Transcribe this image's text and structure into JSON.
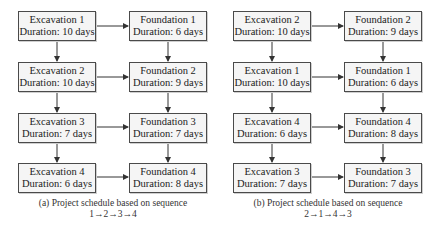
{
  "panels": [
    {
      "id": "a",
      "caption_line1": "(a) Project schedule based on sequence",
      "caption_line2": "1→2→3→4",
      "rows": [
        {
          "excavation": {
            "name": "Excavation  1",
            "duration": "Duration: 10 days"
          },
          "foundation": {
            "name": "Foundation  1",
            "duration": "Duration: 6 days"
          }
        },
        {
          "excavation": {
            "name": "Excavation  2",
            "duration": "Duration: 10 days"
          },
          "foundation": {
            "name": "Foundation  2",
            "duration": "Duration: 9 days"
          }
        },
        {
          "excavation": {
            "name": "Excavation  3",
            "duration": "Duration: 7 days"
          },
          "foundation": {
            "name": "Foundation  3",
            "duration": "Duration: 7 days"
          }
        },
        {
          "excavation": {
            "name": "Excavation  4",
            "duration": "Duration: 6 days"
          },
          "foundation": {
            "name": "Foundation  4",
            "duration": "Duration: 8 days"
          }
        }
      ]
    },
    {
      "id": "b",
      "caption_line1": "(b) Project schedule based on sequence",
      "caption_line2": "2→1→4→3",
      "rows": [
        {
          "excavation": {
            "name": "Excavation  2",
            "duration": "Duration: 10 days"
          },
          "foundation": {
            "name": "Foundation  2",
            "duration": "Duration: 9 days"
          }
        },
        {
          "excavation": {
            "name": "Excavation  1",
            "duration": "Duration: 10 days"
          },
          "foundation": {
            "name": "Foundation  1",
            "duration": "Duration: 6 days"
          }
        },
        {
          "excavation": {
            "name": "Excavation  4",
            "duration": "Duration: 6 days"
          },
          "foundation": {
            "name": "Foundation  4",
            "duration": "Duration: 8 days"
          }
        },
        {
          "excavation": {
            "name": "Excavation  3",
            "duration": "Duration: 7 days"
          },
          "foundation": {
            "name": "Foundation  3",
            "duration": "Duration: 7 days"
          }
        }
      ]
    }
  ]
}
